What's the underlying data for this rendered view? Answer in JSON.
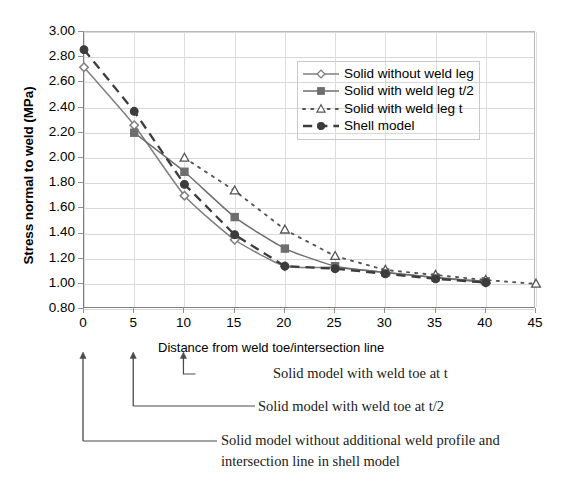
{
  "chart_data": {
    "type": "line",
    "title": "",
    "xlabel": "Distance from weld toe/intersection line",
    "ylabel": "Stress normal to weld (MPa)",
    "xlim": [
      0,
      45
    ],
    "ylim": [
      0.8,
      3.0
    ],
    "xticks": [
      0,
      5,
      10,
      15,
      20,
      25,
      30,
      35,
      40,
      45
    ],
    "yticks": [
      "3.00",
      "2.80",
      "2.60",
      "2.40",
      "2.20",
      "2.00",
      "1.80",
      "1.60",
      "1.40",
      "1.20",
      "1.00",
      "0.80"
    ],
    "grid": "horizontal and vertical gridlines",
    "legend_position": "inside upper-right",
    "series": [
      {
        "name": "Solid without weld leg",
        "marker": "open-diamond",
        "line_style": "solid",
        "color": "#7f7f7f",
        "x": [
          0,
          5,
          10,
          15,
          20,
          25,
          30,
          35,
          40
        ],
        "values": [
          2.72,
          2.26,
          1.7,
          1.35,
          1.14,
          1.13,
          1.09,
          1.05,
          1.01
        ]
      },
      {
        "name": "Solid with weld leg t/2",
        "marker": "filled-square",
        "line_style": "solid",
        "color": "#6e6e6e",
        "x": [
          5,
          10,
          15,
          20,
          25,
          30,
          35,
          40
        ],
        "values": [
          2.2,
          1.89,
          1.53,
          1.28,
          1.14,
          1.09,
          1.05,
          1.02
        ]
      },
      {
        "name": "Solid with weld leg t",
        "marker": "open-triangle",
        "line_style": "dotted",
        "color": "#555555",
        "x": [
          10,
          15,
          20,
          25,
          30,
          35,
          40,
          45
        ],
        "values": [
          2.0,
          1.74,
          1.43,
          1.22,
          1.11,
          1.07,
          1.03,
          1.0
        ]
      },
      {
        "name": "Shell model",
        "marker": "filled-circle",
        "line_style": "dashed",
        "color": "#3c3c3c",
        "x": [
          0,
          5,
          10,
          15,
          20,
          25,
          30,
          35,
          40
        ],
        "values": [
          2.86,
          2.37,
          1.79,
          1.39,
          1.14,
          1.12,
          1.08,
          1.04,
          1.01
        ]
      }
    ],
    "annotations": [
      {
        "text": "Solid model with weld toe at t",
        "points_to_x": 10
      },
      {
        "text": "Solid model with weld toe at t/2",
        "points_to_x": 5
      },
      {
        "text": "Solid model without additional weld profile and",
        "text_line2": "intersection line in shell model",
        "points_to_x": 0
      }
    ]
  }
}
